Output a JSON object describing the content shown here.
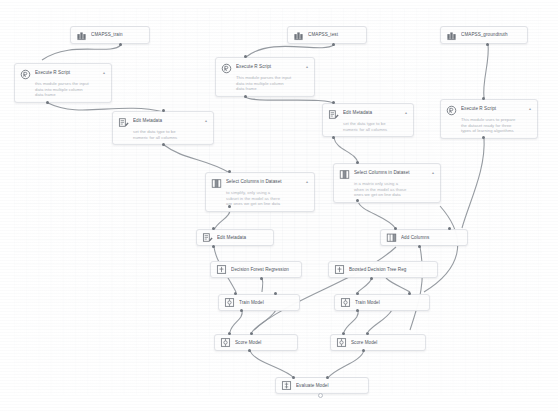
{
  "canvas": {
    "background_color": "#fdfdfd",
    "grid_color": "#d7dbe2",
    "edge_color": "#8d9299",
    "node_border_color": "#e2e4e8",
    "node_title_color": "#4a5059",
    "node_desc_color": "#aeb3ba",
    "port_color": "#6f757d"
  },
  "nodes": {
    "cmapss_train": {
      "title": "CMAPSS_train",
      "icon": "dataset-icon"
    },
    "cmapss_test": {
      "title": "CMAPSS_test",
      "icon": "dataset-icon"
    },
    "cmapss_groundtruth": {
      "title": "CMAPSS_groundtruth",
      "icon": "dataset-icon"
    },
    "execute_r_script_train": {
      "title": "Execute R Script",
      "icon": "r-script-icon",
      "caret": "▴",
      "desc_line1": "this module parses the input",
      "desc_line2": "data into multiple column",
      "desc_line3": "data frame"
    },
    "execute_r_script_test": {
      "title": "Execute R Script",
      "icon": "r-script-icon",
      "caret": "▴",
      "desc_line1": "This module parses the input",
      "desc_line2": "data into multiple column",
      "desc_line3": "data frame"
    },
    "execute_r_script_truth": {
      "title": "Execute R Script",
      "icon": "r-script-icon",
      "caret": "▴",
      "desc_line1": "This module uses to prepare",
      "desc_line2": "the dataset ready for three",
      "desc_line3": "types of learning algorithms"
    },
    "edit_metadata_train": {
      "title": "Edit Metadata",
      "icon": "edit-metadata-icon",
      "caret": "▴",
      "desc_line1": "set the data type to be",
      "desc_line2": "numeric for all columns"
    },
    "edit_metadata_test": {
      "title": "Edit Metadata",
      "icon": "edit-metadata-icon",
      "caret": "▴",
      "desc_line1": "set the data type to be",
      "desc_line2": "numeric for all columns"
    },
    "select_columns_train": {
      "title": "Select Columns in Dataset",
      "icon": "select-columns-icon",
      "caret": "▴",
      "desc_line1": "to simplify, only using a",
      "desc_line2": "subset in the model as there",
      "desc_line3": "are ones we get on line data"
    },
    "select_columns_test": {
      "title": "Select Columns in Dataset",
      "icon": "select-columns-icon",
      "caret": "▴",
      "desc_line1": "in a matrix only using a",
      "desc_line2": "when in the model as those",
      "desc_line3": "ones we get on line data"
    },
    "edit_metadata_lower": {
      "title": "Edit Metadata",
      "icon": "edit-metadata-icon"
    },
    "add_columns": {
      "title": "Add Columns",
      "icon": "add-columns-icon"
    },
    "decision_forest_regression": {
      "title": "Decision Forest Regression",
      "icon": "algorithm-icon"
    },
    "boosted_decision_tree_regression": {
      "title": "Boosted Decision Tree Reg",
      "icon": "algorithm-icon"
    },
    "train_model_left": {
      "title": "Train Model",
      "icon": "train-model-icon"
    },
    "train_model_right": {
      "title": "Train Model",
      "icon": "train-model-icon"
    },
    "score_model_left": {
      "title": "Score Model",
      "icon": "score-model-icon"
    },
    "score_model_right": {
      "title": "Score Model",
      "icon": "score-model-icon"
    },
    "evaluate_model": {
      "title": "Evaluate Model",
      "icon": "evaluate-model-icon"
    }
  }
}
